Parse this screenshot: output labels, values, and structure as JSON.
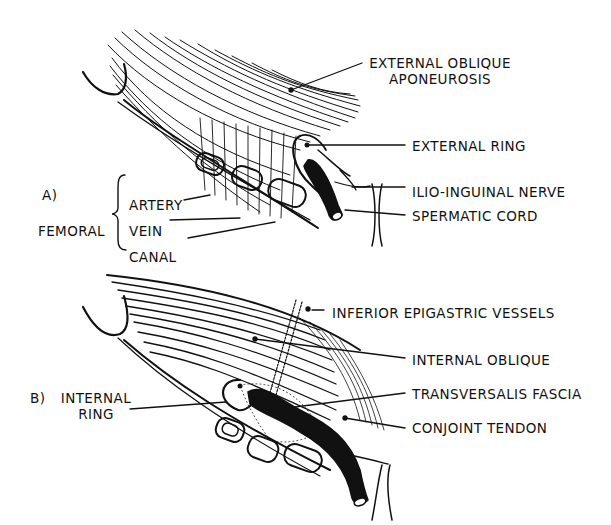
{
  "figure": {
    "panel_a": {
      "marker": "A)",
      "femoral_group_label": "FEMORAL",
      "femoral_items": [
        "ARTERY",
        "VEIN",
        "CANAL"
      ],
      "labels": {
        "external_oblique_line1": "EXTERNAL OBLIQUE",
        "external_oblique_line2": "APONEUROSIS",
        "external_ring": "EXTERNAL RING",
        "ilio_inguinal_nerve": "ILIO-INGUINAL NERVE",
        "spermatic_cord": "SPERMATIC CORD"
      }
    },
    "panel_b": {
      "marker": "B)",
      "internal_ring_line1": "INTERNAL",
      "internal_ring_line2": "RING",
      "labels": {
        "inferior_epigastric_vessels": "INFERIOR EPIGASTRIC VESSELS",
        "internal_oblique": "INTERNAL OBLIQUE",
        "transversalis_fascia": "TRANSVERSALIS FASCIA",
        "conjoint_tendon": "CONJOINT TENDON"
      }
    },
    "colors": {
      "ink": "#111111",
      "paper": "#ffffff"
    }
  }
}
